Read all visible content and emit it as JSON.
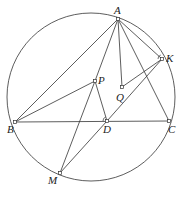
{
  "diagram": {
    "type": "geometry",
    "circle": {
      "cx": 91,
      "cy": 97,
      "r": 84
    },
    "points": {
      "A": {
        "x": 118,
        "y": 19,
        "label": "A",
        "lx": 114,
        "ly": 14
      },
      "K": {
        "x": 162,
        "y": 59,
        "label": "K",
        "lx": 166,
        "ly": 62
      },
      "P": {
        "x": 95,
        "y": 81,
        "label": "P",
        "lx": 98,
        "ly": 84
      },
      "Q": {
        "x": 122,
        "y": 87,
        "label": "Q",
        "lx": 116,
        "ly": 101
      },
      "B": {
        "x": 15,
        "y": 122,
        "label": "B",
        "lx": 7,
        "ly": 133
      },
      "D": {
        "x": 107,
        "y": 121,
        "label": "D",
        "lx": 103,
        "ly": 133
      },
      "C": {
        "x": 169,
        "y": 121,
        "label": "C",
        "lx": 168,
        "ly": 133
      },
      "M": {
        "x": 60,
        "y": 173,
        "label": "M",
        "lx": 48,
        "ly": 184
      }
    },
    "segments": [
      [
        "A",
        "B"
      ],
      [
        "A",
        "P"
      ],
      [
        "A",
        "Q"
      ],
      [
        "A",
        "C"
      ],
      [
        "A",
        "K"
      ],
      [
        "B",
        "C"
      ],
      [
        "B",
        "P"
      ],
      [
        "P",
        "D"
      ],
      [
        "P",
        "M"
      ],
      [
        "Q",
        "K"
      ],
      [
        "M",
        "D"
      ],
      [
        "D",
        "K"
      ]
    ],
    "angle_marks": [
      "K",
      "D"
    ]
  }
}
